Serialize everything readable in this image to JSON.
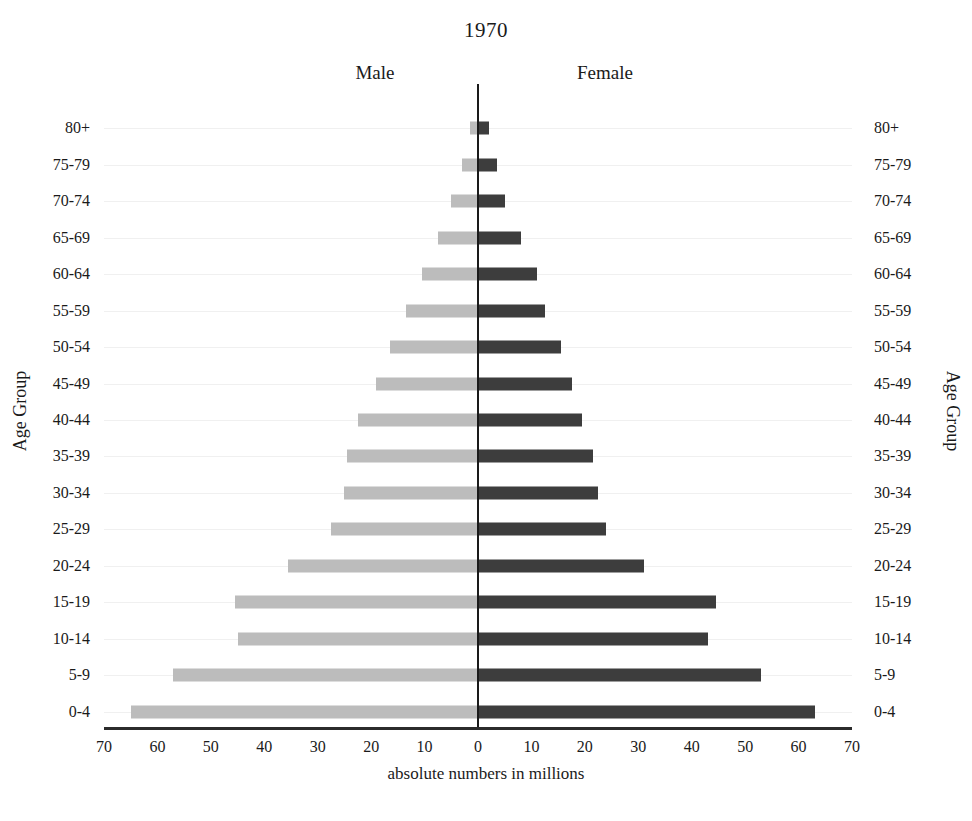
{
  "chart_data": {
    "type": "bar",
    "subtype": "population-pyramid",
    "title": "1970",
    "xlabel": "absolute numbers in millions",
    "ylabel": "Age Group",
    "ylabel_right": "Age Group",
    "grid": true,
    "legend_position": "top-inline",
    "xlim": [
      -70,
      70
    ],
    "xtick_values": [
      -70,
      -60,
      -50,
      -40,
      -30,
      -20,
      -10,
      0,
      10,
      20,
      30,
      40,
      50,
      60,
      70
    ],
    "xtick_labels": [
      "70",
      "60",
      "50",
      "40",
      "30",
      "20",
      "10",
      "0",
      "10",
      "20",
      "30",
      "40",
      "50",
      "60",
      "70"
    ],
    "categories": [
      "0-4",
      "5-9",
      "10-14",
      "15-19",
      "20-24",
      "25-29",
      "30-34",
      "35-39",
      "40-44",
      "45-49",
      "50-54",
      "55-59",
      "60-64",
      "65-69",
      "70-74",
      "75-79",
      "80+"
    ],
    "series": [
      {
        "name": "Male",
        "side": "left",
        "color": "#bcbcbc",
        "values": [
          65.0,
          57.0,
          45.0,
          45.5,
          35.5,
          27.5,
          25.0,
          24.5,
          22.5,
          19.0,
          16.5,
          13.5,
          10.5,
          7.5,
          5.0,
          3.0,
          1.5
        ]
      },
      {
        "name": "Female",
        "side": "right",
        "color": "#3d3d3d",
        "values": [
          63.0,
          53.0,
          43.0,
          44.5,
          31.0,
          24.0,
          22.5,
          21.5,
          19.5,
          17.5,
          15.5,
          12.5,
          11.0,
          8.0,
          5.0,
          3.5,
          2.0
        ]
      }
    ]
  },
  "header": {
    "male_label": "Male",
    "female_label": "Female"
  }
}
